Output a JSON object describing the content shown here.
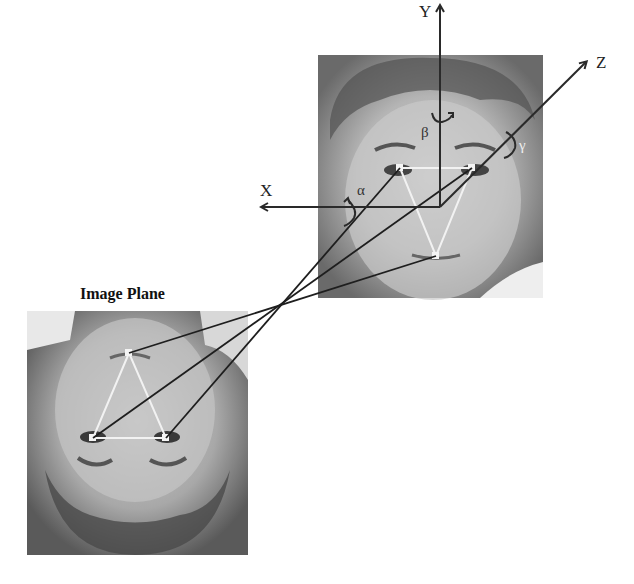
{
  "figure": {
    "image_plane_label": "Image Plane",
    "axes": {
      "x_label": "X",
      "y_label": "Y",
      "z_label": "Z"
    },
    "rotations": {
      "alpha": "α",
      "beta": "β",
      "gamma": "γ"
    },
    "colors": {
      "background": "#ffffff",
      "axis": "#2a2a2a",
      "projection_line": "#1e1e1e",
      "landmark_triangle": "#f2f2f2"
    },
    "landmarks_3d": [
      {
        "name": "left-eye",
        "x": 400,
        "y": 168
      },
      {
        "name": "right-eye",
        "x": 472,
        "y": 168
      },
      {
        "name": "nose",
        "x": 436,
        "y": 256
      }
    ],
    "landmarks_image_plane": [
      {
        "name": "nose",
        "x": 129,
        "y": 353
      },
      {
        "name": "left-eye",
        "x": 93,
        "y": 438
      },
      {
        "name": "right-eye",
        "x": 166,
        "y": 438
      }
    ]
  }
}
